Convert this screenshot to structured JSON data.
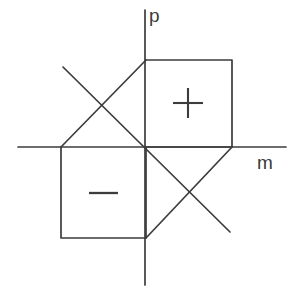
{
  "figure": {
    "background_color": "#ffffff",
    "stroke_color": "#3c3c3c",
    "stroke_width": 1.6,
    "width": 294,
    "height": 298,
    "origin": {
      "x": 145,
      "y": 147
    }
  },
  "axes": {
    "vertical": {
      "name": "p",
      "label": "p",
      "label_position": {
        "x": 149,
        "y": 6
      },
      "x": 145,
      "y_start": 10,
      "y_end": 285
    },
    "horizontal": {
      "name": "m",
      "label": "m",
      "label_position": {
        "x": 257,
        "y": 153
      },
      "y": 147,
      "x_start": 18,
      "x_end": 286
    }
  },
  "regions": [
    {
      "name": "positive-square",
      "sign_label": "+",
      "quadrant": "upper-right",
      "corners": [
        {
          "x": 146,
          "y": 60
        },
        {
          "x": 232,
          "y": 60
        },
        {
          "x": 232,
          "y": 147
        },
        {
          "x": 146,
          "y": 147
        }
      ],
      "sign_center": {
        "x": 188,
        "y": 103
      }
    },
    {
      "name": "negative-square",
      "sign_label": "−",
      "quadrant": "lower-left",
      "corners": [
        {
          "x": 61,
          "y": 147
        },
        {
          "x": 146,
          "y": 147
        },
        {
          "x": 146,
          "y": 238
        },
        {
          "x": 61,
          "y": 238
        }
      ],
      "sign_center": {
        "x": 103,
        "y": 193
      }
    }
  ],
  "diagonals": [
    {
      "name": "upper-left-edge",
      "from": {
        "x": 146,
        "y": 60
      },
      "to": {
        "x": 61,
        "y": 147
      }
    },
    {
      "name": "lower-right-edge",
      "from": {
        "x": 232,
        "y": 147
      },
      "to": {
        "x": 146,
        "y": 238
      }
    },
    {
      "name": "descending-diagonal",
      "from": {
        "x": 63,
        "y": 67
      },
      "to": {
        "x": 230,
        "y": 232
      }
    }
  ],
  "crossings": [
    {
      "name": "upper-left-crossing",
      "x": 103,
      "y": 104
    },
    {
      "name": "lower-right-crossing",
      "x": 189,
      "y": 191
    }
  ]
}
